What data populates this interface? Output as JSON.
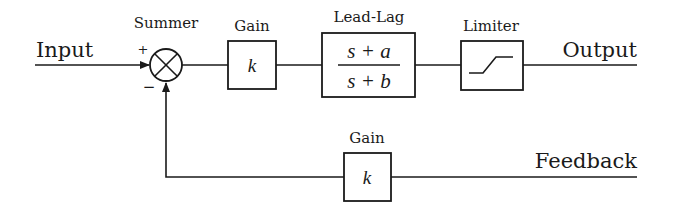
{
  "diagram": {
    "type": "control-loop-block-diagram",
    "signals": {
      "input": "Input",
      "output": "Output",
      "feedback": "Feedback"
    },
    "summer": {
      "label": "Summer",
      "plus_sign": "+",
      "minus_sign": "−",
      "symbol": "⊗"
    },
    "blocks": {
      "forward_gain": {
        "title": "Gain",
        "content": "k"
      },
      "lead_lag": {
        "title": "Lead-Lag",
        "numerator": "s + a",
        "denominator": "s + b"
      },
      "limiter": {
        "title": "Limiter",
        "icon": "saturation-curve-icon"
      },
      "feedback_gain": {
        "title": "Gain",
        "content": "k"
      }
    },
    "colors": {
      "line": "#1a1a1a",
      "background": "#ffffff"
    }
  }
}
